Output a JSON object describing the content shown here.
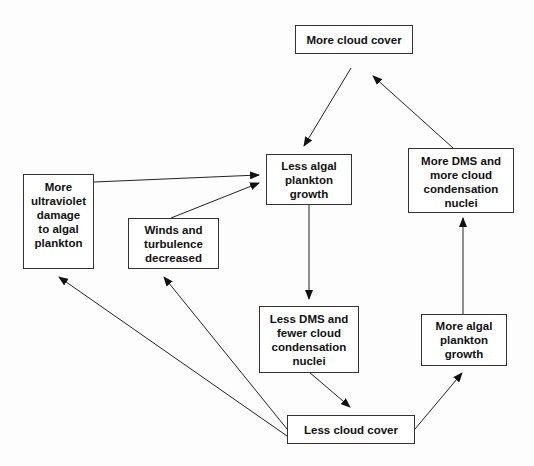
{
  "diagram": {
    "nodes": [
      {
        "id": "more_cloud_cover",
        "label": "More cloud cover"
      },
      {
        "id": "less_algal_growth",
        "label": "Less algal\nplankton\ngrowth"
      },
      {
        "id": "more_dms",
        "label": "More DMS and\nmore cloud\ncondensation\nnuclei"
      },
      {
        "id": "uv_damage",
        "label": "More\nultraviolet\ndamage\nto algal\nplankton"
      },
      {
        "id": "winds",
        "label": "Winds and\nturbulence\ndecreased"
      },
      {
        "id": "less_dms",
        "label": "Less DMS and\nfewer cloud\ncondensation\nnuclei"
      },
      {
        "id": "more_algal_growth",
        "label": "More algal\nplankton\ngrowth"
      },
      {
        "id": "less_cloud_cover",
        "label": "Less cloud cover"
      }
    ],
    "edges": [
      {
        "from": "more_cloud_cover",
        "to": "less_algal_growth"
      },
      {
        "from": "more_dms",
        "to": "more_cloud_cover"
      },
      {
        "from": "uv_damage",
        "to": "less_algal_growth"
      },
      {
        "from": "winds",
        "to": "less_algal_growth"
      },
      {
        "from": "less_algal_growth",
        "to": "less_dms"
      },
      {
        "from": "less_dms",
        "to": "less_cloud_cover"
      },
      {
        "from": "less_cloud_cover",
        "to": "more_algal_growth"
      },
      {
        "from": "more_algal_growth",
        "to": "more_dms"
      },
      {
        "from": "less_cloud_cover",
        "to": "uv_damage"
      },
      {
        "from": "less_cloud_cover",
        "to": "winds"
      }
    ]
  }
}
